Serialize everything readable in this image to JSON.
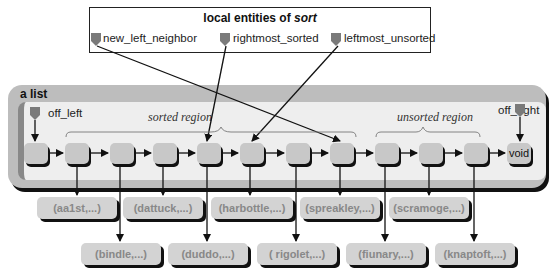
{
  "locals": {
    "title_prefix": "local entities of ",
    "title_emph": "sort",
    "pointers": [
      {
        "name": "new_left_neighbor"
      },
      {
        "name": "rightmost_sorted"
      },
      {
        "name": "leftmost_unsorted"
      }
    ]
  },
  "list": {
    "title": "a list",
    "off_left": "off_left",
    "off_right": "off_right",
    "sorted_region": "sorted region",
    "unsorted_region": "unsorted region",
    "void_label": "void"
  },
  "records": {
    "top_row": [
      "(aa1st,...)",
      "(dattuck,...)",
      "(harbottle,...)",
      "(spreakley,...)",
      "(scramoge,...)"
    ],
    "bottom_row": [
      "(bindle,...)",
      "(duddo,...)",
      "( rigolet,...)",
      "(fiunary,...)",
      "(knaptoft,...)"
    ]
  },
  "colors": {
    "frame": "#bdbdbd",
    "inner": "#eeeeee",
    "cell": "#c8c8c8",
    "record": "#d3d3d3",
    "record_text": "#888888",
    "pointer_icon": "#7a7a7a"
  }
}
